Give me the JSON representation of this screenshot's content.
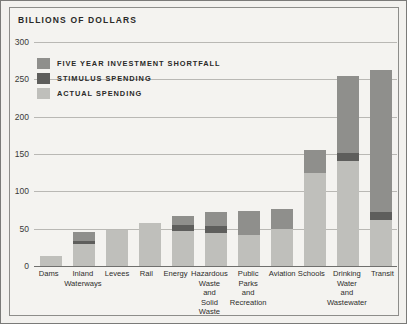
{
  "chart_data": {
    "type": "bar",
    "title": "BILLIONS OF DOLLARS",
    "xlabel": "",
    "ylabel": "Billions of Dollars",
    "ylim": [
      0,
      300
    ],
    "yticks": [
      0,
      50,
      100,
      150,
      200,
      250,
      300
    ],
    "grid": true,
    "stacked": true,
    "legend_position": "top-left",
    "categories": [
      "Dams",
      "Inland Waterways",
      "Levees",
      "Rail",
      "Energy",
      "Hazardous Waste and Solid Waste",
      "Public Parks and Recreation",
      "Aviation",
      "Schools",
      "Drinking Water and Wastewater",
      "Transit"
    ],
    "category_lines": [
      [
        "Dams"
      ],
      [
        "Inland",
        "Waterways"
      ],
      [
        "Levees"
      ],
      [
        "Rail"
      ],
      [
        "Energy"
      ],
      [
        "Hazardous",
        "Waste",
        "and",
        "Solid",
        "Waste"
      ],
      [
        "Public",
        "Parks",
        "and",
        "Recreation"
      ],
      [
        "Aviation"
      ],
      [
        "Schools"
      ],
      [
        "Drinking",
        "Water",
        "and",
        "Wastewater"
      ],
      [
        "Transit"
      ]
    ],
    "series": [
      {
        "name": "ACTUAL SPENDING",
        "color": "#bfbfbb",
        "values": [
          13,
          29,
          48,
          58,
          47,
          44,
          41,
          50,
          125,
          140,
          62
        ]
      },
      {
        "name": "STIMULUS SPENDING",
        "color": "#5e5e5c",
        "values": [
          0,
          5,
          0,
          0,
          8,
          10,
          0,
          0,
          0,
          11,
          11
        ]
      },
      {
        "name": "FIVE YEAR INVESTMENT SHORTFALL",
        "color": "#8f8f8c",
        "values": [
          0,
          11,
          0,
          0,
          12,
          18,
          33,
          26,
          30,
          104,
          189
        ]
      }
    ],
    "totals": [
      13,
      45,
      48,
      58,
      67,
      72,
      74,
      76,
      155,
      255,
      262
    ]
  },
  "legend": {
    "items": [
      {
        "label": "FIVE YEAR INVESTMENT SHORTFALL",
        "color": "#8f8f8c"
      },
      {
        "label": "STIMULUS SPENDING",
        "color": "#5e5e5c"
      },
      {
        "label": "ACTUAL SPENDING",
        "color": "#bfbfbb"
      }
    ]
  }
}
